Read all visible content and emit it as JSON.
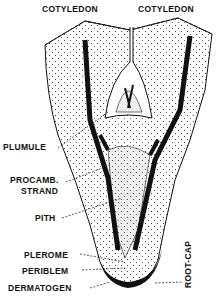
{
  "diagram": {
    "labels": {
      "cotyledon_left": "COTYLEDON",
      "cotyledon_right": "COTYLEDON",
      "plumule": "PLUMULE",
      "procamb_line1": "PROCAMB.",
      "procamb_line2": "STRAND",
      "pith": "PITH",
      "plerome": "PLEROME",
      "periblem": "PERIBLEM",
      "dermatogen": "DERMATOGEN",
      "root_cap": "ROOT-CAP"
    },
    "colors": {
      "ink": "#111111",
      "background": "#ffffff"
    }
  }
}
